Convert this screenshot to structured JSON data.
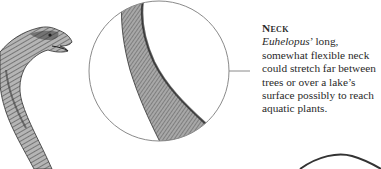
{
  "caption": {
    "heading": "Neck",
    "species": "Euhelopus",
    "body_after_species": "’ long, somewhat flexible neck could stretch far between trees or over a lake’s surface possibly to reach aquatic plants."
  },
  "illustration": {
    "subject": "Euhelopus dinosaur head and neck",
    "magnifier": "circular close-up of neck skin texture",
    "colors": {
      "circle_stroke": "#8a8a8a",
      "leader_line": "#8a8a8a",
      "skin_light": "#b8b8b8",
      "skin_dark": "#3a3a3a",
      "partial_arc": "#333333"
    }
  }
}
